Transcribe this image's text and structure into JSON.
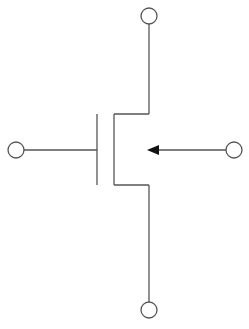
{
  "diagram": {
    "type": "mosfet-symbol",
    "terminals": [
      {
        "id": "drain",
        "position": "top"
      },
      {
        "id": "gate",
        "position": "left"
      },
      {
        "id": "body",
        "position": "right"
      },
      {
        "id": "source",
        "position": "bottom"
      }
    ],
    "arrow_direction": "inward",
    "colors": {
      "line": "#555555",
      "arrowhead": "#111111",
      "background": "#ffffff"
    }
  }
}
